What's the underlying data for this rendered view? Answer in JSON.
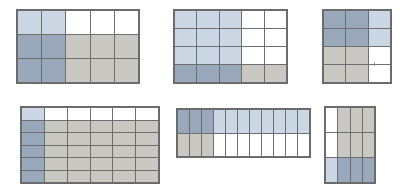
{
  "figure": {
    "background_color": "#ffffff",
    "line_color": "#6a6a6a",
    "palette": {
      "white": "#ffffff",
      "light_blue": "#ccd7e6",
      "blue_gray": "#9aa8bb",
      "warm_gray": "#c9c8c2",
      "mid_gray": "#b8b7b1"
    },
    "panel_count": 6
  },
  "chart_data": {
    "type": "heatmap",
    "xlabel": "",
    "ylabel": "",
    "grid": true,
    "legend": "none",
    "panels": [
      {
        "id": "panel-1",
        "label": "top-left",
        "position": {
          "x": 16,
          "y": 9,
          "width": 124,
          "height": 75
        },
        "columns": 5,
        "rows": 3,
        "cells": [
          [
            "light_blue",
            "light_blue",
            "white",
            "white",
            "white"
          ],
          [
            "blue_gray",
            "blue_gray",
            "warm_gray",
            "warm_gray",
            "warm_gray"
          ],
          [
            "blue_gray",
            "blue_gray",
            "warm_gray",
            "warm_gray",
            "warm_gray"
          ]
        ]
      },
      {
        "id": "panel-2",
        "label": "top-middle",
        "position": {
          "x": 173,
          "y": 9,
          "width": 115,
          "height": 75
        },
        "columns": 5,
        "rows": 4,
        "cells": [
          [
            "light_blue",
            "light_blue",
            "light_blue",
            "white",
            "white"
          ],
          [
            "light_blue",
            "light_blue",
            "light_blue",
            "white",
            "white"
          ],
          [
            "light_blue",
            "light_blue",
            "light_blue",
            "white",
            "white"
          ],
          [
            "blue_gray",
            "blue_gray",
            "blue_gray",
            "warm_gray",
            "warm_gray"
          ]
        ]
      },
      {
        "id": "panel-3",
        "label": "top-right",
        "position": {
          "x": 322,
          "y": 9,
          "width": 70,
          "height": 75
        },
        "columns": 3,
        "rows": 4,
        "cells": [
          [
            "blue_gray",
            "blue_gray",
            "light_blue"
          ],
          [
            "blue_gray",
            "blue_gray",
            "light_blue"
          ],
          [
            "warm_gray",
            "warm_gray",
            "white"
          ],
          [
            "warm_gray",
            "warm_gray",
            "white"
          ]
        ],
        "marks": [
          {
            "name": "speck",
            "x": 51,
            "y": 52
          }
        ]
      },
      {
        "id": "panel-4",
        "label": "bottom-left",
        "position": {
          "x": 20,
          "y": 106,
          "width": 140,
          "height": 78
        },
        "columns": 6,
        "rows": 6,
        "cells": [
          [
            "light_blue",
            "white",
            "white",
            "white",
            "white",
            "white"
          ],
          [
            "blue_gray",
            "warm_gray",
            "warm_gray",
            "warm_gray",
            "warm_gray",
            "warm_gray"
          ],
          [
            "blue_gray",
            "warm_gray",
            "warm_gray",
            "warm_gray",
            "warm_gray",
            "warm_gray"
          ],
          [
            "blue_gray",
            "warm_gray",
            "warm_gray",
            "warm_gray",
            "warm_gray",
            "warm_gray"
          ],
          [
            "blue_gray",
            "warm_gray",
            "warm_gray",
            "warm_gray",
            "warm_gray",
            "warm_gray"
          ],
          [
            "blue_gray",
            "warm_gray",
            "warm_gray",
            "warm_gray",
            "warm_gray",
            "warm_gray"
          ]
        ]
      },
      {
        "id": "panel-5",
        "label": "bottom-middle",
        "position": {
          "x": 176,
          "y": 108,
          "width": 135,
          "height": 50
        },
        "columns": 11,
        "rows": 2,
        "cells": [
          [
            "blue_gray",
            "blue_gray",
            "blue_gray",
            "light_blue",
            "light_blue",
            "light_blue",
            "light_blue",
            "light_blue",
            "light_blue",
            "light_blue",
            "light_blue"
          ],
          [
            "warm_gray",
            "warm_gray",
            "warm_gray",
            "white",
            "white",
            "white",
            "white",
            "white",
            "white",
            "white",
            "white"
          ]
        ]
      },
      {
        "id": "panel-6",
        "label": "bottom-right",
        "position": {
          "x": 324,
          "y": 106,
          "width": 52,
          "height": 78
        },
        "columns": 4,
        "rows": 3,
        "cells": [
          [
            "white",
            "warm_gray",
            "warm_gray",
            "warm_gray"
          ],
          [
            "white",
            "warm_gray",
            "warm_gray",
            "warm_gray"
          ],
          [
            "light_blue",
            "blue_gray",
            "blue_gray",
            "blue_gray"
          ]
        ]
      }
    ]
  }
}
